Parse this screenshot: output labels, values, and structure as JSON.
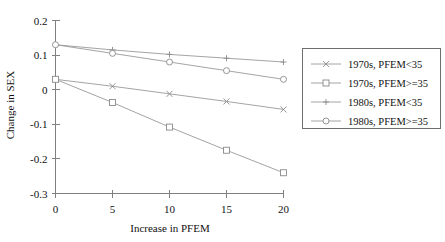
{
  "chart_data": {
    "type": "line",
    "title": "",
    "xlabel": "Increase in PFEM",
    "ylabel": "Change in SEX",
    "x": [
      0,
      5,
      10,
      15,
      20
    ],
    "xlim": [
      0,
      20
    ],
    "ylim": [
      -0.3,
      0.2
    ],
    "xticks": [
      "0",
      "5",
      "10",
      "15",
      "20"
    ],
    "yticks": [
      "0.2",
      "0.1",
      "0",
      "-0.1",
      "-0.2",
      "-0.3"
    ],
    "ytick_values": [
      0.2,
      0.1,
      0,
      -0.1,
      -0.2,
      -0.3
    ],
    "grid": false,
    "legend_position": "right-outside",
    "series": [
      {
        "name": "1970s, PFEM<35",
        "marker": "x-cross",
        "values": [
          0.03,
          0.01,
          -0.012,
          -0.034,
          -0.057
        ]
      },
      {
        "name": "1970s, PFEM>=35",
        "marker": "open-square",
        "values": [
          0.03,
          -0.037,
          -0.108,
          -0.175,
          -0.24
        ]
      },
      {
        "name": "1980s, PFEM<35",
        "marker": "plus",
        "values": [
          0.13,
          0.115,
          0.102,
          0.091,
          0.08
        ]
      },
      {
        "name": "1980s, PFEM>=35",
        "marker": "open-circle",
        "values": [
          0.13,
          0.105,
          0.08,
          0.055,
          0.03
        ]
      }
    ]
  },
  "legend": {
    "entries": [
      {
        "label": "1970s, PFEM<35"
      },
      {
        "label": "1970s, PFEM>=35"
      },
      {
        "label": "1980s, PFEM<35"
      },
      {
        "label": "1980s, PFEM>=35"
      }
    ]
  },
  "colors": {
    "line": "#9a9a9a",
    "axis": "#808080",
    "text": "#111111",
    "legend_border": "#6e6e6e",
    "background": "#ffffff"
  }
}
